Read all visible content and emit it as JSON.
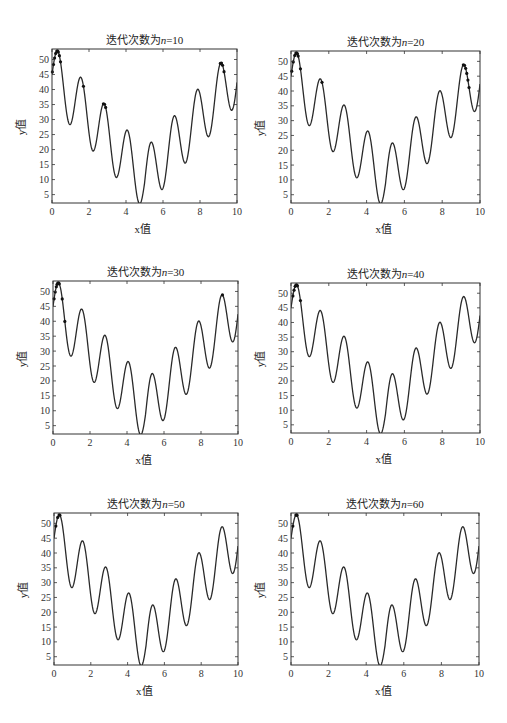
{
  "figure": {
    "function_label": "y = 10·sin(5x) + 7·|x − 5| + 10",
    "axis_labels": {
      "x": "x值",
      "y": "y值"
    },
    "x_ticks": [
      "0",
      "2",
      "4",
      "6",
      "8",
      "10"
    ],
    "y_ticks": [
      "5",
      "10",
      "15",
      "20",
      "25",
      "30",
      "35",
      "40",
      "45",
      "50"
    ]
  },
  "panels": [
    {
      "title_prefix": "迭代次数为",
      "title_var": "n",
      "title_value": "=10",
      "box": [
        52,
        49,
        237,
        203
      ],
      "population_x": [
        0.02,
        0.08,
        0.14,
        0.2,
        0.26,
        0.3,
        0.34,
        0.4,
        0.46,
        1.7,
        2.78,
        2.84,
        2.9,
        9.1,
        9.16,
        9.22,
        9.3
      ]
    },
    {
      "title_prefix": "迭代次数为",
      "title_var": "n",
      "title_value": "=20",
      "box": [
        291,
        51,
        480,
        203
      ],
      "population_x": [
        0.04,
        0.12,
        0.2,
        0.26,
        0.3,
        0.34,
        0.38,
        0.5,
        1.64,
        9.12,
        9.18,
        9.24,
        9.3,
        9.36,
        9.42
      ]
    },
    {
      "title_prefix": "迭代次数为",
      "title_var": "n",
      "title_value": "=30",
      "box": [
        53,
        281,
        238,
        434
      ],
      "population_x": [
        0.06,
        0.12,
        0.18,
        0.22,
        0.26,
        0.3,
        0.34,
        0.5,
        0.64,
        9.16
      ]
    },
    {
      "title_prefix": "迭代次数为",
      "title_var": "n",
      "title_value": "=40",
      "box": [
        291,
        283,
        480,
        433
      ],
      "population_x": [
        0.1,
        0.16,
        0.22,
        0.26,
        0.3,
        0.34,
        0.5
      ]
    },
    {
      "title_prefix": "迭代次数为",
      "title_var": "n",
      "title_value": "=50",
      "box": [
        54,
        513,
        238,
        665
      ],
      "population_x": [
        0.1,
        0.2,
        0.28,
        0.32
      ]
    },
    {
      "title_prefix": "迭代次数为",
      "title_var": "n",
      "title_value": "=60",
      "box": [
        291,
        513,
        479,
        665
      ],
      "population_x": [
        0.1,
        0.26,
        0.3,
        0.32
      ]
    }
  ],
  "chart_data": [
    {
      "type": "line",
      "title": "迭代次数为n=10",
      "xlabel": "x值",
      "ylabel": "y值",
      "xlim": [
        0,
        10
      ],
      "ylim": [
        2.2,
        53.5
      ],
      "series": [
        {
          "name": "f(x)=10sin(5x)+7|x-5|+10",
          "kind": "curve"
        },
        {
          "name": "population",
          "kind": "scatter",
          "x": [
            0.02,
            0.08,
            0.14,
            0.2,
            0.26,
            0.3,
            0.34,
            0.4,
            0.46,
            1.7,
            2.78,
            2.84,
            2.9,
            9.1,
            9.16,
            9.22,
            9.3
          ]
        }
      ]
    },
    {
      "type": "line",
      "title": "迭代次数为n=20",
      "xlabel": "x值",
      "ylabel": "y值",
      "xlim": [
        0,
        10
      ],
      "ylim": [
        2.2,
        53.5
      ],
      "series": [
        {
          "name": "f(x)=10sin(5x)+7|x-5|+10",
          "kind": "curve"
        },
        {
          "name": "population",
          "kind": "scatter",
          "x": [
            0.04,
            0.12,
            0.2,
            0.26,
            0.3,
            0.34,
            0.38,
            0.5,
            1.64,
            9.12,
            9.18,
            9.24,
            9.3,
            9.36,
            9.42
          ]
        }
      ]
    },
    {
      "type": "line",
      "title": "迭代次数为n=30",
      "xlabel": "x值",
      "ylabel": "y值",
      "xlim": [
        0,
        10
      ],
      "ylim": [
        2.2,
        53.5
      ],
      "series": [
        {
          "name": "f(x)=10sin(5x)+7|x-5|+10",
          "kind": "curve"
        },
        {
          "name": "population",
          "kind": "scatter",
          "x": [
            0.06,
            0.12,
            0.18,
            0.22,
            0.26,
            0.3,
            0.34,
            0.5,
            0.64,
            9.16
          ]
        }
      ]
    },
    {
      "type": "line",
      "title": "迭代次数为n=40",
      "xlabel": "x值",
      "ylabel": "y值",
      "xlim": [
        0,
        10
      ],
      "ylim": [
        2.2,
        53.5
      ],
      "series": [
        {
          "name": "f(x)=10sin(5x)+7|x-5|+10",
          "kind": "curve"
        },
        {
          "name": "population",
          "kind": "scatter",
          "x": [
            0.1,
            0.16,
            0.22,
            0.26,
            0.3,
            0.34,
            0.5
          ]
        }
      ]
    },
    {
      "type": "line",
      "title": "迭代次数为n=50",
      "xlabel": "x值",
      "ylabel": "y值",
      "xlim": [
        0,
        10
      ],
      "ylim": [
        2.2,
        53.5
      ],
      "series": [
        {
          "name": "f(x)=10sin(5x)+7|x-5|+10",
          "kind": "curve"
        },
        {
          "name": "population",
          "kind": "scatter",
          "x": [
            0.1,
            0.2,
            0.28,
            0.32
          ]
        }
      ]
    },
    {
      "type": "line",
      "title": "迭代次数为n=60",
      "xlabel": "x值",
      "ylabel": "y值",
      "xlim": [
        0,
        10
      ],
      "ylim": [
        2.2,
        53.5
      ],
      "series": [
        {
          "name": "f(x)=10sin(5x)+7|x-5|+10",
          "kind": "curve"
        },
        {
          "name": "population",
          "kind": "scatter",
          "x": [
            0.1,
            0.26,
            0.3,
            0.32
          ]
        }
      ]
    }
  ]
}
